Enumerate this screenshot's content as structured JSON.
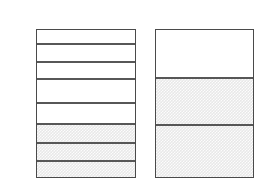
{
  "figure": {
    "background_color": "#ffffff",
    "line_color": "#4f4f4f",
    "fill_color": "#e8e8e8",
    "empty_color": "#ffffff",
    "columns": [
      {
        "name": "left-column",
        "x": 36,
        "y": 29,
        "width": 100,
        "height": 149,
        "segment_count": 8,
        "filled_count": 3,
        "empty_count": 5,
        "segments": [
          {
            "index": 1,
            "top": 29,
            "bottom": 44,
            "state": "empty"
          },
          {
            "index": 2,
            "top": 44,
            "bottom": 62,
            "state": "empty"
          },
          {
            "index": 3,
            "top": 62,
            "bottom": 79,
            "state": "empty"
          },
          {
            "index": 4,
            "top": 79,
            "bottom": 103,
            "state": "empty"
          },
          {
            "index": 5,
            "top": 103,
            "bottom": 124,
            "state": "empty"
          },
          {
            "index": 6,
            "top": 124,
            "bottom": 143,
            "state": "filled"
          },
          {
            "index": 7,
            "top": 143,
            "bottom": 161,
            "state": "filled"
          },
          {
            "index": 8,
            "top": 161,
            "bottom": 178,
            "state": "filled"
          }
        ]
      },
      {
        "name": "right-column",
        "x": 155,
        "y": 29,
        "width": 99,
        "height": 149,
        "segment_count": 3,
        "filled_count": 2,
        "empty_count": 1,
        "segments": [
          {
            "index": 1,
            "top": 29,
            "bottom": 78,
            "state": "empty"
          },
          {
            "index": 2,
            "top": 78,
            "bottom": 125,
            "state": "filled"
          },
          {
            "index": 3,
            "top": 125,
            "bottom": 178,
            "state": "filled"
          }
        ]
      }
    ]
  },
  "chart_data": {
    "type": "bar",
    "title": "",
    "subtitle": "",
    "xlabel": "",
    "ylabel": "",
    "categories": [
      "left-column",
      "right-column"
    ],
    "series": [
      {
        "name": "total segments",
        "values": [
          8,
          3
        ]
      },
      {
        "name": "shaded segments",
        "values": [
          3,
          2
        ]
      },
      {
        "name": "unshaded segments",
        "values": [
          5,
          1
        ]
      }
    ],
    "shaded_fraction": [
      0.375,
      0.667
    ],
    "legend": [],
    "grid": false,
    "ylim": [
      0,
      8
    ]
  }
}
